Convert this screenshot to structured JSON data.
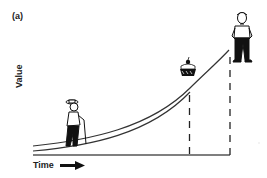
{
  "figure": {
    "panel_label": "(a)",
    "y_axis_label": "Value",
    "x_axis_label": "Time",
    "illustrations": {
      "start": "elderly-man-with-cane",
      "middle": "cake-with-cherry",
      "end": "young-man-standing"
    },
    "colors": {
      "line": "#333333",
      "axis": "#555555",
      "figure_fill": "#111111",
      "background": "#ffffff"
    }
  }
}
